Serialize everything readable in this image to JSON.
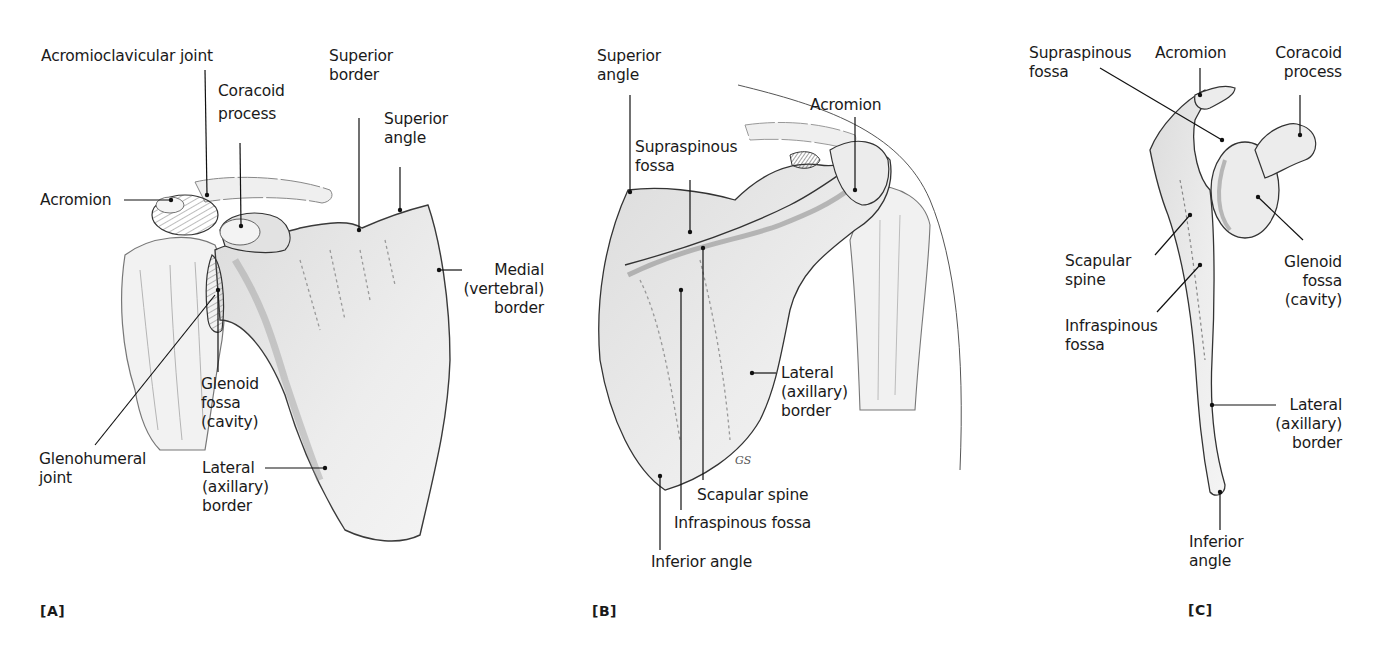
{
  "figure": {
    "panels": [
      {
        "tag": "[A]",
        "view": "anterior",
        "labels": {
          "acromioclavicular_joint": "Acromioclavicular joint",
          "coracoid_process": [
            "Coracoid",
            "process"
          ],
          "superior_border": [
            "Superior",
            "border"
          ],
          "superior_angle": [
            "Superior",
            "angle"
          ],
          "acromion": "Acromion",
          "medial_border": [
            "Medial",
            "(vertebral)",
            "border"
          ],
          "glenoid_fossa": [
            "Glenoid",
            "fossa",
            "(cavity)"
          ],
          "glenohumeral_joint": [
            "Glenohumeral",
            "joint"
          ],
          "lateral_border": [
            "Lateral",
            "(axillary)",
            "border"
          ]
        }
      },
      {
        "tag": "[B]",
        "view": "posterior",
        "labels": {
          "superior_angle": [
            "Superior",
            "angle"
          ],
          "acromion": "Acromion",
          "supraspinous_fossa": [
            "Supraspinous",
            "fossa"
          ],
          "lateral_border": [
            "Lateral",
            "(axillary)",
            "border"
          ],
          "scapular_spine": "Scapular spine",
          "infraspinous_fossa": "Infraspinous fossa",
          "inferior_angle": "Inferior angle"
        },
        "artist_signature": "GS"
      },
      {
        "tag": "[C]",
        "view": "lateral",
        "labels": {
          "supraspinous_fossa": [
            "Supraspinous",
            "fossa"
          ],
          "acromion": "Acromion",
          "coracoid_process": [
            "Coracoid",
            "process"
          ],
          "scapular_spine": [
            "Scapular",
            "spine"
          ],
          "glenoid_fossa": [
            "Glenoid",
            "fossa",
            "(cavity)"
          ],
          "infraspinous_fossa": [
            "Infraspinous",
            "fossa"
          ],
          "lateral_border": [
            "Lateral",
            "(axillary)",
            "border"
          ],
          "inferior_angle": [
            "Inferior",
            "angle"
          ]
        }
      }
    ],
    "colors": {
      "bone_fill": "#e9e9e9",
      "bone_shade": "#c9c9c9",
      "outline": "#2a2a2a",
      "leader_line": "#111111",
      "background": "#ffffff"
    }
  }
}
